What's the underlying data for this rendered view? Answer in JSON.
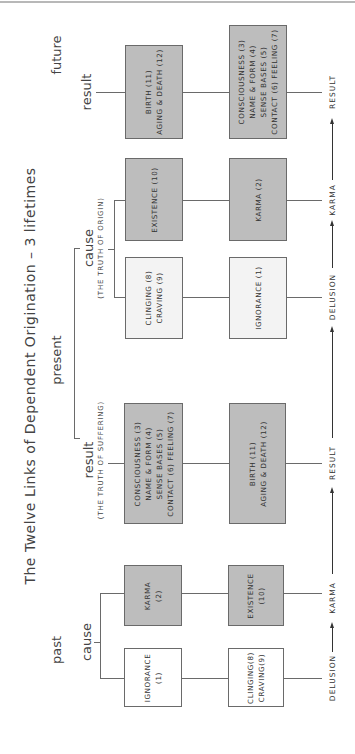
{
  "title": "The Twelve Links of Dependent Origination – 3 lifetimes",
  "periods": {
    "past": "past",
    "present": "present",
    "future": "future"
  },
  "segments": {
    "past_cause": "cause",
    "present_result": "result",
    "present_result_truth": "(THE TRUTH OF SUFFERING)",
    "present_cause": "cause",
    "present_cause_truth": "(THE TRUTH OF ORIGIN)",
    "future_result": "result"
  },
  "boxes": {
    "past_ignorance": {
      "line1": "IGNORANCE",
      "line2": "(1)"
    },
    "past_clinging": {
      "line1": "CLINGING(8)",
      "line2": "CRAVING(9)"
    },
    "past_karma": {
      "line1": "KARMA",
      "line2": "(2)"
    },
    "past_existence": {
      "line1": "EXISTENCE",
      "line2": "(10)"
    },
    "present_result_consciousness": {
      "line1": "CONSCIOUSNESS (3)",
      "line2": "NAME & FORM (4)",
      "line3": "SENSE BASES (5)",
      "line4": "CONTACT (6) FEELING (7)"
    },
    "present_result_birth": {
      "line1": "BIRTH (11)",
      "line2": "AGING & DEATH (12)"
    },
    "present_cause_clinging": {
      "line1": "CLINGING (8)",
      "line2": "CRAVING (9)"
    },
    "present_cause_ignorance": {
      "line1": "IGNORANCE (1)"
    },
    "present_cause_existence": {
      "line1": "EXISTENCE (10)"
    },
    "present_cause_karma": {
      "line1": "KARMA (2)"
    },
    "future_birth": {
      "line1": "BIRTH (11)",
      "line2": "AGING & DEATH (12)"
    },
    "future_consciousness": {
      "line1": "CONSCIOUSNESS (3)",
      "line2": "NAME & FORM (4)",
      "line3": "SENSE BASES (5)",
      "line4": "CONTACT (6) FEELING (7)"
    }
  },
  "flow": {
    "past_delusion": "DELUSION",
    "past_karma": "KARMA",
    "present_result": "RESULT",
    "present_delusion": "DELUSION",
    "present_karma": "KARMA",
    "future_result": "RESULT"
  },
  "colors": {
    "dark_box": "#bdbdbd",
    "light_box": "#f3f3f3",
    "white_box": "#ffffff",
    "line": "#6a6a6a"
  }
}
